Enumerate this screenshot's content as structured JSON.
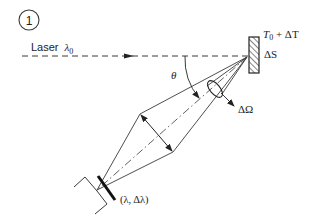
{
  "figure": {
    "number": "1",
    "labels": {
      "laser": "Laser",
      "laser_symbol": "λ",
      "laser_sub": "0",
      "temperature": "T",
      "temperature_sub": "0",
      "temperature_rest": " + ΔT",
      "area": "ΔS",
      "angle": "θ",
      "solid_angle": "ΔΩ",
      "spectral": "(λ, Δλ)"
    },
    "colors": {
      "stroke": "#3a3a3a",
      "text": "#222222",
      "background": "#ffffff"
    }
  }
}
